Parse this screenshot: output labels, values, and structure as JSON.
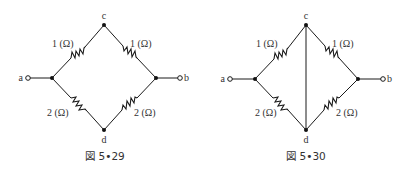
{
  "figures": [
    {
      "caption": "図 5•29",
      "nodes": {
        "a": "a",
        "b": "b",
        "c": "c",
        "d": "d"
      },
      "resistors": {
        "a_c": "1 (Ω)",
        "c_b": "1 (Ω)",
        "a_d": "2 (Ω)",
        "d_b": "2 (Ω)"
      },
      "has_cd_wire": false
    },
    {
      "caption": "図 5•30",
      "nodes": {
        "a": "a",
        "b": "b",
        "c": "c",
        "d": "d"
      },
      "resistors": {
        "a_c": "1 (Ω)",
        "c_b": "1 (Ω)",
        "a_d": "2 (Ω)",
        "d_b": "2 (Ω)"
      },
      "has_cd_wire": true
    }
  ]
}
